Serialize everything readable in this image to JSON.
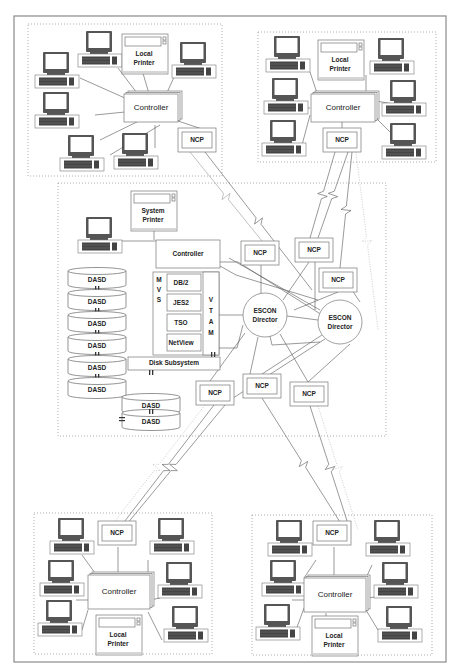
{
  "diagram": {
    "title": "",
    "groups": {
      "top_left": {
        "controller": "Controller",
        "printer": "Local\nPrinter",
        "printer_lines": [
          "Local",
          "Printer"
        ],
        "ncp": "NCP",
        "terminals": 6
      },
      "top_right": {
        "controller": "Controller",
        "printer_lines": [
          "Local",
          "Printer"
        ],
        "ncp": "NCP",
        "terminals": 6
      },
      "bottom_left": {
        "controller": "Controller",
        "printer_lines": [
          "Local",
          "Printer"
        ],
        "ncp": "NCP",
        "terminals": 6
      },
      "bottom_right": {
        "controller": "Controller",
        "printer_lines": [
          "Local",
          "Printer"
        ],
        "ncp": "NCP",
        "terminals": 6
      }
    },
    "host": {
      "system_printer_lines": [
        "System",
        "Printer"
      ],
      "controller": "Controller",
      "mvs_letters": [
        "M",
        "V",
        "S"
      ],
      "subsystems": [
        "DB/2",
        "JES2",
        "TSO",
        "NetView"
      ],
      "vtam_letters": [
        "V",
        "T",
        "A",
        "M"
      ],
      "disk_subsystem": "Disk Subsystem",
      "dasd_label": "DASD",
      "dasd_count": 8
    },
    "escon": [
      {
        "lines": [
          "ESCON",
          "Director"
        ]
      },
      {
        "lines": [
          "ESCON",
          "Director"
        ]
      }
    ],
    "host_ncps": [
      "NCP",
      "NCP",
      "NCP",
      "NCP",
      "NCP",
      "NCP"
    ]
  }
}
